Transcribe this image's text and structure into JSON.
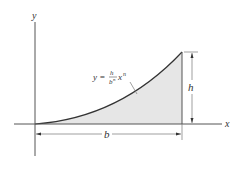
{
  "diagram": {
    "axes": {
      "x_label": "x",
      "y_label": "y"
    },
    "curve": {
      "equation_lhs": "y =",
      "numerator": "h",
      "denominator": "b",
      "denominator_exp": "n",
      "variable": "x",
      "variable_exp": "n"
    },
    "dimensions": {
      "width_label": "b",
      "height_label": "h"
    },
    "colors": {
      "fill": "#e6e6e6",
      "stroke": "#333333",
      "line": "#555555"
    }
  }
}
